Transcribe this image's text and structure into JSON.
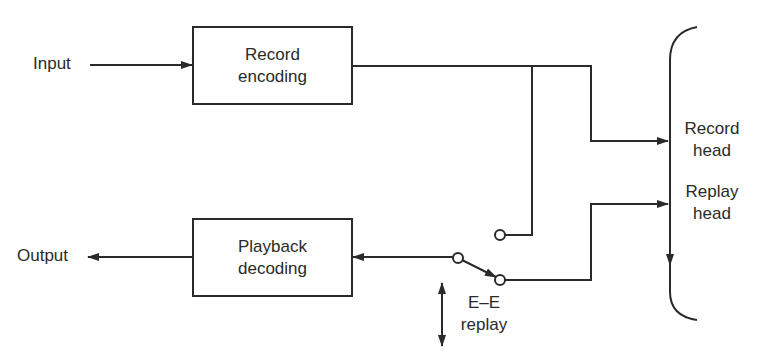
{
  "diagram": {
    "blocks": {
      "record_encoding": {
        "line1": "Record",
        "line2": "encoding"
      },
      "playback_decoding": {
        "line1": "Playback",
        "line2": "decoding"
      }
    },
    "terminals": {
      "input": "Input",
      "output": "Output"
    },
    "heads": {
      "record_head": {
        "line1": "Record",
        "line2": "head"
      },
      "replay_head": {
        "line1": "Replay",
        "line2": "head"
      }
    },
    "switch": {
      "label_line1": "E–E",
      "label_line2": "replay"
    },
    "colors": {
      "ink": "#2a2a2a",
      "background": "#ffffff"
    }
  }
}
